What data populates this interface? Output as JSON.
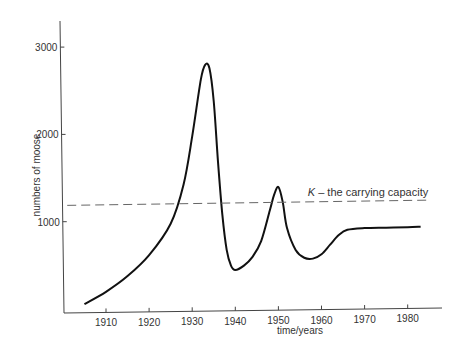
{
  "chart_data": {
    "type": "line",
    "title": "",
    "xlabel": "time/years",
    "ylabel": "numbers of moose",
    "xlim": [
      1901,
      1988
    ],
    "ylim": [
      0,
      3300
    ],
    "grid": false,
    "legend": null,
    "x_ticks": [
      1910,
      1920,
      1930,
      1940,
      1950,
      1960,
      1970,
      1980
    ],
    "y_ticks": [
      1000,
      2000,
      3000
    ],
    "series": [
      {
        "name": "moose population",
        "style": "solid",
        "x": [
          1905,
          1910,
          1915,
          1920,
          1925,
          1928,
          1930,
          1932,
          1933,
          1934,
          1935,
          1936,
          1937,
          1938,
          1939,
          1940,
          1942,
          1944,
          1946,
          1948,
          1949,
          1950,
          1951,
          1952,
          1954,
          1956,
          1958,
          1960,
          1962,
          1964,
          1966,
          1970,
          1975,
          1980,
          1983
        ],
        "values": [
          80,
          220,
          400,
          640,
          1000,
          1450,
          2000,
          2650,
          2820,
          2780,
          2400,
          1700,
          1100,
          700,
          520,
          470,
          520,
          620,
          800,
          1150,
          1330,
          1420,
          1250,
          950,
          700,
          610,
          600,
          650,
          760,
          870,
          930,
          950,
          955,
          960,
          965
        ]
      },
      {
        "name": "K – the carrying capacity",
        "style": "dashed",
        "x": [
          1901,
          1985
        ],
        "values": [
          1210,
          1270
        ]
      }
    ],
    "annotations": [
      {
        "text_prefix": "K",
        "text_suffix": " – the carrying capacity",
        "x": 1970,
        "y": 1340
      }
    ]
  },
  "labels": {
    "xlabel": "time/years",
    "ylabel": "numbers of moose",
    "annotation_k": "K",
    "annotation_rest": " – the carrying capacity"
  }
}
